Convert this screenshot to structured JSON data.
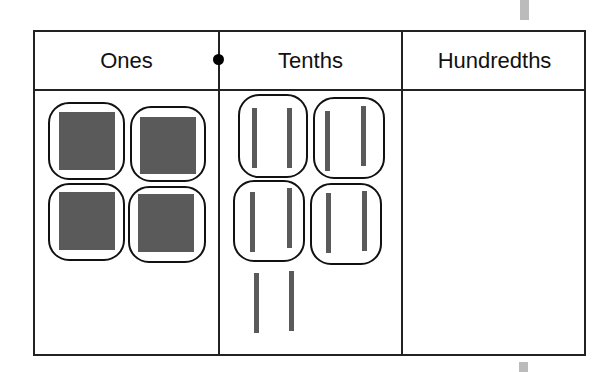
{
  "diagram": {
    "type": "place-value-chart",
    "columns": [
      {
        "label": "Ones",
        "grouped_items": 4,
        "item_type": "ones-square"
      },
      {
        "label": "Tenths",
        "grouped_items": 8,
        "loose_items": 2,
        "item_type": "tenths-rod",
        "groups": 4,
        "items_per_group": 2
      },
      {
        "label": "Hundredths",
        "items": 0
      }
    ],
    "decimal_point_between": [
      "Ones",
      "Tenths"
    ],
    "colors": {
      "block": "#5a5a5a",
      "border": "#222222",
      "loop": "#111111"
    }
  }
}
